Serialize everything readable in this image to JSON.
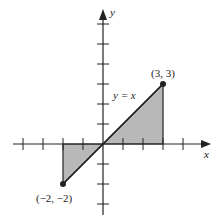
{
  "diagram": {
    "type": "graph-of-function",
    "function_label": "y = x",
    "x_axis_label": "x",
    "y_axis_label": "y",
    "x_ticks": [
      -4,
      -3,
      -2,
      -1,
      1,
      2,
      3,
      4
    ],
    "y_ticks": [
      -3,
      -2,
      -1,
      1,
      2,
      3,
      4,
      5,
      6
    ],
    "segment": {
      "from": [
        -2,
        -2
      ],
      "to": [
        3,
        3
      ]
    },
    "endpoints": [
      {
        "label": "(3, 3)",
        "x": 3,
        "y": 3
      },
      {
        "label": "(−2, −2)",
        "x": -2,
        "y": -2
      }
    ],
    "shaded_regions": [
      {
        "name": "region-above",
        "vertices": [
          [
            0,
            0
          ],
          [
            3,
            3
          ],
          [
            3,
            0
          ]
        ]
      },
      {
        "name": "region-below",
        "vertices": [
          [
            -2,
            0
          ],
          [
            -2,
            -2
          ],
          [
            0,
            0
          ]
        ]
      }
    ],
    "colors": {
      "shade": "#b8b8b8",
      "line": "#222222"
    }
  }
}
